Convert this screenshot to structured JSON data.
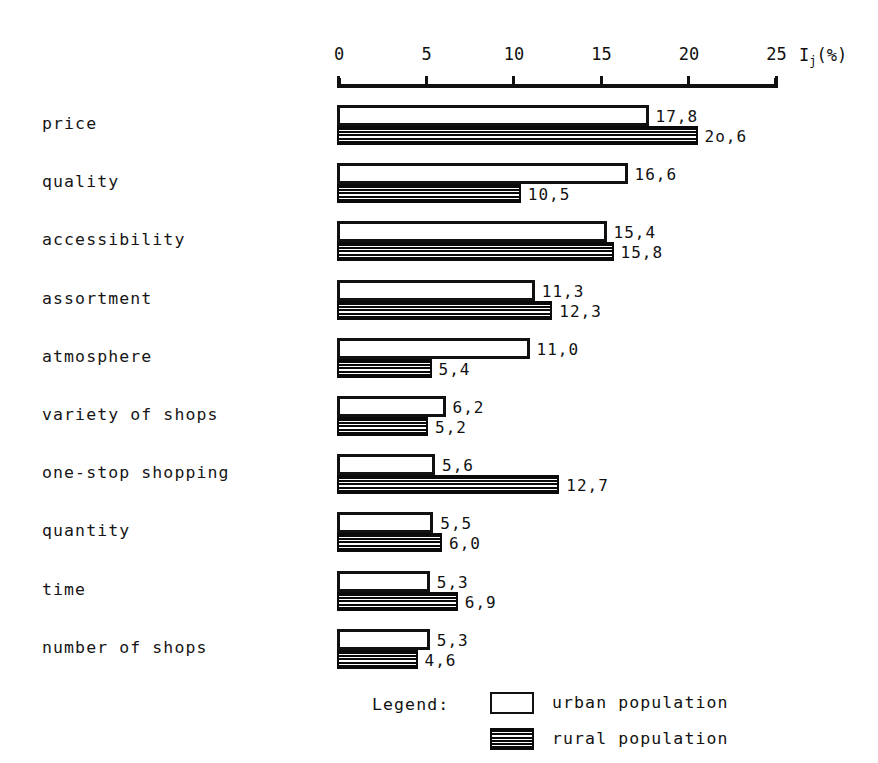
{
  "chart_data": {
    "type": "bar",
    "orientation": "horizontal",
    "title": "",
    "xlabel": "I_j(%)",
    "ylabel": "",
    "xlim": [
      0,
      25
    ],
    "grid": false,
    "legend_position": "bottom",
    "categories": [
      "price",
      "quality",
      "accessibility",
      "assortment",
      "atmosphere",
      "variety of shops",
      "one-stop shopping",
      "quantity",
      "time",
      "number of shops"
    ],
    "series": [
      {
        "name": "urban population",
        "values": [
          17.8,
          16.6,
          15.4,
          11.3,
          11.0,
          6.2,
          5.6,
          5.5,
          5.3,
          5.3
        ],
        "labels": [
          "17,8",
          "16,6",
          "15,4",
          "11,3",
          "11,0",
          "6,2",
          "5,6",
          "5,5",
          "5,3",
          "5,3"
        ]
      },
      {
        "name": "rural population",
        "values": [
          20.6,
          10.5,
          15.8,
          12.3,
          5.4,
          5.2,
          12.7,
          6.0,
          6.9,
          4.6
        ],
        "labels": [
          "2o,6",
          "10,5",
          "15,8",
          "12,3",
          "5,4",
          "5,2",
          "12,7",
          "6,0",
          "6,9",
          "4,6"
        ]
      }
    ],
    "x_ticks": [
      0,
      5,
      10,
      15,
      20,
      25
    ],
    "x_tick_labels": [
      "0",
      "5",
      "10",
      "15",
      "20",
      "25"
    ]
  },
  "axis": {
    "title_main": "I",
    "title_sub": "j",
    "title_unit": "(%)"
  },
  "legend": {
    "label": "Legend:",
    "entries": [
      {
        "key": "urban",
        "text": "urban population"
      },
      {
        "key": "rural",
        "text": "rural population"
      }
    ]
  },
  "colors": {
    "ink": "#111111",
    "paper": "#ffffff",
    "rural_fill": "#0a0a0a"
  }
}
